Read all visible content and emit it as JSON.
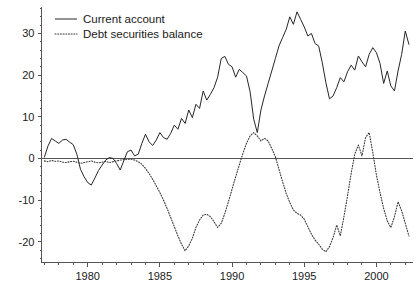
{
  "chart_data": {
    "type": "line",
    "title": "",
    "subtitle": "",
    "xlabel": "",
    "ylabel": "",
    "xlim": [
      1976.8,
      2002.5
    ],
    "ylim": [
      -25,
      36
    ],
    "grid": false,
    "legend_position": "top-left",
    "xticks": [
      1980,
      1985,
      1990,
      1995,
      2000
    ],
    "xtick_labels": [
      "1980",
      "1985",
      "1990",
      "1995",
      "2000"
    ],
    "xminor_tick_interval": 1,
    "yticks": [
      -20,
      -10,
      0,
      10,
      20,
      30
    ],
    "ytick_labels": [
      "-20",
      "-10",
      "0",
      "10",
      "20",
      "30"
    ],
    "yminor_tick_interval": 2,
    "zero_reference_line": 0,
    "series": [
      {
        "name": "Current account",
        "style": "solid",
        "color": "#262626",
        "x": [
          1977.0,
          1977.25,
          1977.5,
          1977.75,
          1978.0,
          1978.25,
          1978.5,
          1978.75,
          1979.0,
          1979.25,
          1979.5,
          1979.75,
          1980.0,
          1980.25,
          1980.5,
          1980.75,
          1981.0,
          1981.25,
          1981.5,
          1981.75,
          1982.0,
          1982.25,
          1982.5,
          1982.75,
          1983.0,
          1983.25,
          1983.5,
          1983.75,
          1984.0,
          1984.25,
          1984.5,
          1984.75,
          1985.0,
          1985.25,
          1985.5,
          1985.75,
          1986.0,
          1986.25,
          1986.5,
          1986.75,
          1987.0,
          1987.25,
          1987.5,
          1987.75,
          1988.0,
          1988.25,
          1988.5,
          1988.75,
          1989.0,
          1989.25,
          1989.5,
          1989.75,
          1990.0,
          1990.25,
          1990.5,
          1990.75,
          1991.0,
          1991.25,
          1991.5,
          1991.75,
          1992.0,
          1992.25,
          1992.5,
          1992.75,
          1993.0,
          1993.25,
          1993.5,
          1993.75,
          1994.0,
          1994.25,
          1994.5,
          1994.75,
          1995.0,
          1995.25,
          1995.5,
          1995.75,
          1996.0,
          1996.25,
          1996.5,
          1996.75,
          1997.0,
          1997.25,
          1997.5,
          1997.75,
          1998.0,
          1998.25,
          1998.5,
          1998.75,
          1999.0,
          1999.25,
          1999.5,
          1999.75,
          2000.0,
          2000.25,
          2000.5,
          2000.75,
          2001.0,
          2001.25,
          2001.5,
          2001.75,
          2002.0,
          2002.25
        ],
        "y": [
          0.3,
          3.0,
          4.8,
          4.2,
          3.6,
          4.4,
          4.6,
          3.9,
          3.3,
          1.0,
          -2.6,
          -4.4,
          -5.8,
          -6.4,
          -4.7,
          -2.9,
          -1.6,
          -0.4,
          0.2,
          0.0,
          -1.2,
          -2.8,
          -0.6,
          1.6,
          2.0,
          0.6,
          1.0,
          3.6,
          5.8,
          4.0,
          3.1,
          4.4,
          6.2,
          5.0,
          4.6,
          6.0,
          8.0,
          7.0,
          9.6,
          8.4,
          11.6,
          9.8,
          13.0,
          12.0,
          16.2,
          14.0,
          15.4,
          17.0,
          19.5,
          24.0,
          24.5,
          22.6,
          22.0,
          19.5,
          21.4,
          20.6,
          19.8,
          16.0,
          9.4,
          6.2,
          11.6,
          15.0,
          18.0,
          21.0,
          24.0,
          27.0,
          29.0,
          31.0,
          34.0,
          32.2,
          35.2,
          33.4,
          31.6,
          29.4,
          30.0,
          27.6,
          27.0,
          23.0,
          18.2,
          14.3,
          15.0,
          17.0,
          19.4,
          18.4,
          20.8,
          22.4,
          21.2,
          24.6,
          23.2,
          22.0,
          25.0,
          26.6,
          25.4,
          22.8,
          18.0,
          21.0,
          17.4,
          16.2,
          21.0,
          25.0,
          30.6,
          27.4
        ]
      },
      {
        "name": "Debt securities balance",
        "style": "dotted",
        "color": "#3a3a3a",
        "x": [
          1977.0,
          1977.25,
          1977.5,
          1977.75,
          1978.0,
          1978.25,
          1978.5,
          1978.75,
          1979.0,
          1979.25,
          1979.5,
          1979.75,
          1980.0,
          1980.25,
          1980.5,
          1980.75,
          1981.0,
          1981.25,
          1981.5,
          1981.75,
          1982.0,
          1982.25,
          1982.5,
          1982.75,
          1983.0,
          1983.25,
          1983.5,
          1983.75,
          1984.0,
          1984.25,
          1984.5,
          1984.75,
          1985.0,
          1985.25,
          1985.5,
          1985.75,
          1986.0,
          1986.25,
          1986.5,
          1986.75,
          1987.0,
          1987.25,
          1987.5,
          1987.75,
          1988.0,
          1988.25,
          1988.5,
          1988.75,
          1989.0,
          1989.25,
          1989.5,
          1989.75,
          1990.0,
          1990.25,
          1990.5,
          1990.75,
          1991.0,
          1991.25,
          1991.5,
          1991.75,
          1992.0,
          1992.25,
          1992.5,
          1992.75,
          1993.0,
          1993.25,
          1993.5,
          1993.75,
          1994.0,
          1994.25,
          1994.5,
          1994.75,
          1995.0,
          1995.25,
          1995.5,
          1995.75,
          1996.0,
          1996.25,
          1996.5,
          1996.75,
          1997.0,
          1997.25,
          1997.5,
          1997.75,
          1998.0,
          1998.25,
          1998.5,
          1998.75,
          1999.0,
          1999.25,
          1999.5,
          1999.75,
          2000.0,
          2000.25,
          2000.5,
          2000.75,
          2001.0,
          2001.25,
          2001.5,
          2001.75,
          2002.0,
          2002.25
        ],
        "y": [
          -0.6,
          -0.8,
          -0.5,
          -0.7,
          -0.6,
          -0.9,
          -1.0,
          -0.8,
          -0.7,
          -0.9,
          -1.2,
          -1.0,
          -0.8,
          -0.6,
          -0.9,
          -1.1,
          -0.9,
          -0.7,
          -1.0,
          -0.8,
          -0.6,
          -0.4,
          -0.3,
          -0.2,
          -0.2,
          -0.4,
          -0.8,
          -1.4,
          -2.4,
          -3.6,
          -5.0,
          -6.6,
          -8.2,
          -10.0,
          -12.0,
          -14.2,
          -16.4,
          -18.6,
          -20.6,
          -22.2,
          -21.0,
          -19.2,
          -16.6,
          -14.8,
          -13.6,
          -13.4,
          -14.0,
          -15.2,
          -16.6,
          -15.6,
          -13.2,
          -10.4,
          -7.4,
          -4.4,
          -1.6,
          1.2,
          3.6,
          5.4,
          6.2,
          5.4,
          4.2,
          4.8,
          4.2,
          2.4,
          0.4,
          -2.6,
          -5.6,
          -8.4,
          -10.6,
          -12.4,
          -13.2,
          -13.6,
          -14.6,
          -16.4,
          -18.2,
          -19.6,
          -20.6,
          -21.8,
          -22.4,
          -21.2,
          -19.0,
          -16.0,
          -18.6,
          -14.0,
          -9.0,
          -3.6,
          1.0,
          3.2,
          0.6,
          5.0,
          6.2,
          1.4,
          -4.0,
          -8.2,
          -12.0,
          -15.0,
          -16.6,
          -14.0,
          -10.4,
          -12.6,
          -15.6,
          -18.6
        ]
      }
    ]
  },
  "legend": {
    "entries": [
      {
        "label": "Current account",
        "style": "solid"
      },
      {
        "label": "Debt securities balance",
        "style": "dotted"
      }
    ]
  }
}
